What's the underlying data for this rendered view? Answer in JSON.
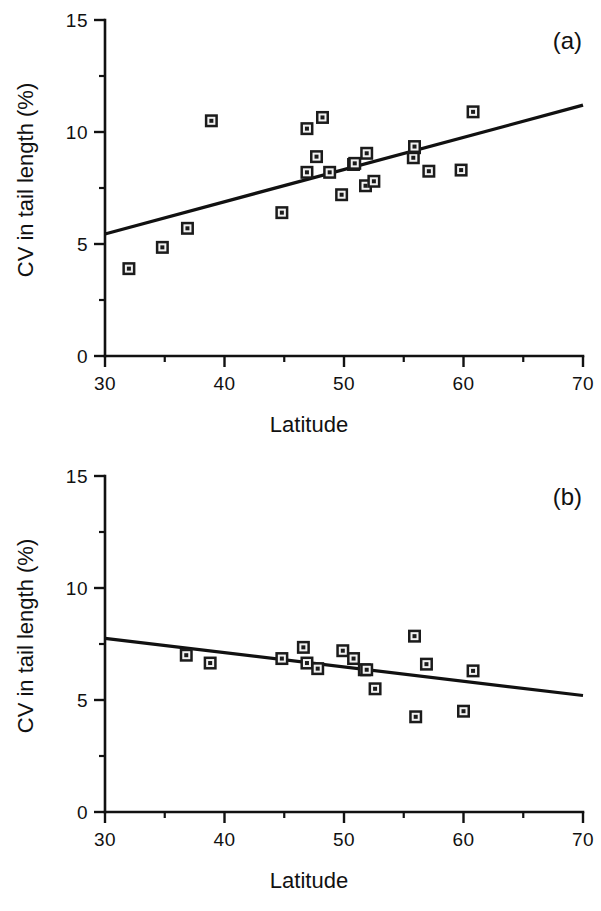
{
  "figure": {
    "background_color": "#ffffff",
    "ink_color": "#111111",
    "width": 601,
    "height": 911
  },
  "panels": [
    {
      "tag": "(a)",
      "tag_name": "panel-label-a"
    },
    {
      "tag": "(b)",
      "tag_name": "panel-label-b"
    }
  ],
  "chart_data": [
    {
      "type": "scatter",
      "title": "",
      "panel_label": "(a)",
      "xlabel": "Latitude",
      "ylabel": "CV in tail length (%)",
      "xlim": [
        30,
        70
      ],
      "ylim": [
        0,
        15
      ],
      "xticks": [
        30,
        40,
        50,
        60,
        70
      ],
      "xtick_labels": [
        "30",
        "40",
        "50",
        "60",
        "70"
      ],
      "xminor_ticks": [
        35,
        45,
        55,
        65
      ],
      "yticks": [
        0,
        5,
        10,
        15
      ],
      "ytick_labels": [
        "0",
        "5",
        "10",
        "15"
      ],
      "yminor_ticks": [
        2.5,
        7.5,
        12.5
      ],
      "grid": false,
      "legend": "none",
      "marker": "square-outlined",
      "x": [
        32.0,
        34.8,
        36.9,
        38.9,
        44.8,
        46.9,
        46.9,
        47.7,
        48.2,
        48.8,
        49.8,
        50.8,
        50.9,
        51.8,
        51.9,
        52.5,
        55.8,
        55.9,
        55.9,
        57.1,
        59.8,
        60.8
      ],
      "y": [
        3.9,
        4.85,
        5.7,
        10.5,
        6.4,
        8.2,
        10.15,
        8.9,
        10.65,
        8.2,
        7.2,
        8.55,
        8.6,
        7.6,
        9.05,
        7.8,
        8.85,
        9.3,
        9.35,
        8.25,
        8.3,
        10.9
      ],
      "points": [
        {
          "x": 32.0,
          "y": 3.9
        },
        {
          "x": 34.8,
          "y": 4.85
        },
        {
          "x": 36.9,
          "y": 5.7
        },
        {
          "x": 38.9,
          "y": 10.5
        },
        {
          "x": 44.8,
          "y": 6.4
        },
        {
          "x": 46.9,
          "y": 8.2
        },
        {
          "x": 46.9,
          "y": 10.15
        },
        {
          "x": 47.7,
          "y": 8.9
        },
        {
          "x": 48.2,
          "y": 10.65
        },
        {
          "x": 48.8,
          "y": 8.2
        },
        {
          "x": 49.8,
          "y": 7.2
        },
        {
          "x": 50.8,
          "y": 8.55
        },
        {
          "x": 50.9,
          "y": 8.6
        },
        {
          "x": 51.8,
          "y": 7.6
        },
        {
          "x": 51.9,
          "y": 9.05
        },
        {
          "x": 52.5,
          "y": 7.8
        },
        {
          "x": 55.8,
          "y": 8.85
        },
        {
          "x": 55.9,
          "y": 9.3
        },
        {
          "x": 55.9,
          "y": 9.35
        },
        {
          "x": 57.1,
          "y": 8.25
        },
        {
          "x": 59.8,
          "y": 8.3
        },
        {
          "x": 60.8,
          "y": 10.9
        }
      ],
      "trendline": {
        "x_start": 30,
        "y_start": 5.45,
        "x_end": 70,
        "y_end": 11.2,
        "direction": "positive"
      }
    },
    {
      "type": "scatter",
      "title": "",
      "panel_label": "(b)",
      "xlabel": "Latitude",
      "ylabel": "CV in tail length (%)",
      "xlim": [
        30,
        70
      ],
      "ylim": [
        0,
        15
      ],
      "xticks": [
        30,
        40,
        50,
        60,
        70
      ],
      "xtick_labels": [
        "30",
        "40",
        "50",
        "60",
        "70"
      ],
      "xminor_ticks": [
        35,
        45,
        55,
        65
      ],
      "yticks": [
        0,
        5,
        10,
        15
      ],
      "ytick_labels": [
        "0",
        "5",
        "10",
        "15"
      ],
      "yminor_ticks": [
        2.5,
        7.5,
        12.5
      ],
      "grid": false,
      "legend": "none",
      "marker": "square-outlined",
      "x": [
        36.8,
        38.8,
        44.8,
        46.6,
        46.9,
        47.8,
        49.9,
        50.8,
        51.7,
        51.9,
        52.6,
        55.9,
        56.0,
        56.9,
        60.0,
        60.8
      ],
      "y": [
        7.0,
        6.65,
        6.85,
        7.35,
        6.65,
        6.4,
        7.2,
        6.85,
        6.35,
        6.35,
        5.5,
        7.85,
        4.25,
        6.6,
        4.5,
        6.3
      ],
      "points": [
        {
          "x": 36.8,
          "y": 7.0
        },
        {
          "x": 38.8,
          "y": 6.65
        },
        {
          "x": 44.8,
          "y": 6.85
        },
        {
          "x": 46.6,
          "y": 7.35
        },
        {
          "x": 46.9,
          "y": 6.65
        },
        {
          "x": 47.8,
          "y": 6.4
        },
        {
          "x": 49.9,
          "y": 7.2
        },
        {
          "x": 50.8,
          "y": 6.85
        },
        {
          "x": 51.7,
          "y": 6.35
        },
        {
          "x": 51.9,
          "y": 6.35
        },
        {
          "x": 52.6,
          "y": 5.5
        },
        {
          "x": 55.9,
          "y": 7.85
        },
        {
          "x": 56.0,
          "y": 4.25
        },
        {
          "x": 56.9,
          "y": 6.6
        },
        {
          "x": 60.0,
          "y": 4.5
        },
        {
          "x": 60.8,
          "y": 6.3
        }
      ],
      "trendline": {
        "x_start": 30,
        "y_start": 7.75,
        "x_end": 70,
        "y_end": 5.2,
        "direction": "negative"
      }
    }
  ]
}
